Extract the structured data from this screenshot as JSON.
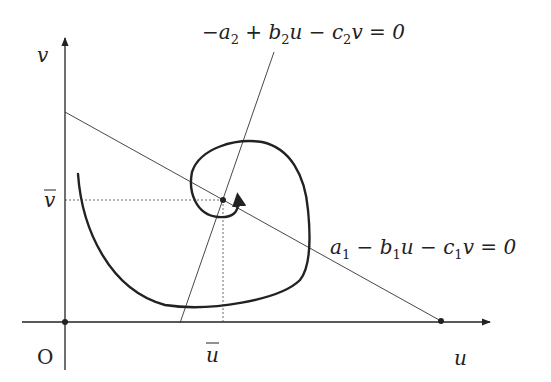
{
  "diagram": {
    "type": "phase-plane",
    "axes": {
      "x_label": "u",
      "y_label": "v",
      "origin_label": "O"
    },
    "equilibrium": {
      "u_label": "u",
      "v_label": "v",
      "u_bar": true,
      "v_bar": true
    },
    "nullclines": [
      {
        "id": "nullcline-1",
        "equation": "a₁ − b₁u − c₁v = 0",
        "parts": [
          "a",
          "1",
          " − b",
          "1",
          "u − c",
          "1",
          "v = 0"
        ]
      },
      {
        "id": "nullcline-2",
        "equation": "−a₂ + b₂u − c₂v = 0",
        "parts": [
          "−a",
          "2",
          " + b",
          "2",
          "u − c",
          "2",
          "v = 0"
        ]
      }
    ],
    "trajectory": {
      "description": "spiral trajectory converging to equilibrium (u-bar, v-bar)",
      "arrow_direction": "counter-clockwise into equilibrium"
    },
    "colors": {
      "stroke": "#222222",
      "background": "#ffffff"
    }
  }
}
